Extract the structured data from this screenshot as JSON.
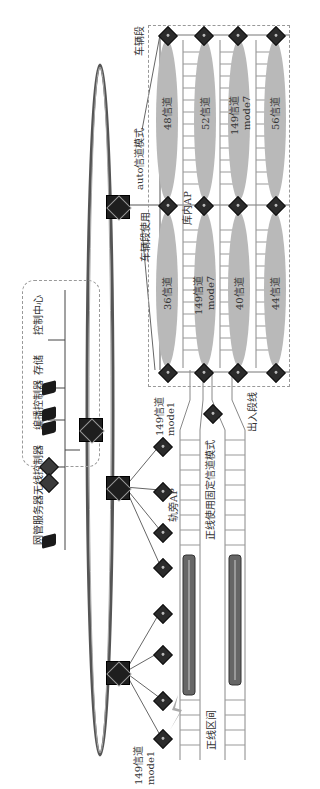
{
  "diagram": {
    "orientation": "rotated 90deg counter-clockwise",
    "control_center": {
      "title": "控制中心",
      "devices": [
        {
          "label": "存储",
          "icon": "storage-icon"
        },
        {
          "label": "编播控制器",
          "icon": "server-icon"
        },
        {
          "label": "无线控制器",
          "icon": "wireless-controller-icon"
        },
        {
          "label": "网管服务器",
          "icon": "server-icon"
        }
      ]
    },
    "ring": {
      "label": ""
    },
    "depot": {
      "section_label": "车辆段",
      "auto_label": "auto信道模式",
      "use_label": "车辆段使用",
      "ap_label": "库内AP",
      "upper_row": [
        {
          "channel": "48信道",
          "mode": ""
        },
        {
          "channel": "52信道",
          "mode": ""
        },
        {
          "channel": "149信道",
          "mode": "mode7"
        },
        {
          "channel": "56信道",
          "mode": ""
        }
      ],
      "lower_row": [
        {
          "channel": "36信道",
          "mode": ""
        },
        {
          "channel": "149信道",
          "mode": "mode7"
        },
        {
          "channel": "40信道",
          "mode": ""
        },
        {
          "channel": "44信道",
          "mode": ""
        }
      ]
    },
    "trackside": {
      "ap_label": "轨旁AP",
      "channel_top": {
        "channel": "149信道",
        "mode": "mode1"
      },
      "channel_bottom": {
        "channel": "149信道",
        "mode": "mode1"
      },
      "fixed_mode_label": "正线使用固定信道模式",
      "exit_line_label": "出入段线",
      "section_label": "正线区间"
    },
    "colors": {
      "ellipse": "#b9b9b9",
      "device": "#2b2b2b",
      "ring": "#555555",
      "track": "#888888"
    }
  }
}
